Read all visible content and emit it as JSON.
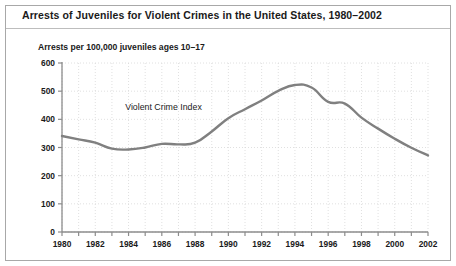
{
  "figure": {
    "title": "Arrests of Juveniles for Violent Crimes in the United States, 1980–2002",
    "axis_caption": "Arrests per 100,000 juveniles ages 10–17",
    "frame_color": "#a8a8a8",
    "background_color": "#ffffff"
  },
  "chart_data": {
    "type": "line",
    "title": "Arrests of Juveniles for Violent Crimes in the United States, 1980–2002",
    "subtitle": "Arrests per 100,000 juveniles ages 10–17",
    "xlabel": "",
    "ylabel": "Arrests per 100,000 juveniles ages 10–17",
    "xlim": [
      1980,
      2002
    ],
    "ylim": [
      0,
      600
    ],
    "yticks": [
      0,
      100,
      200,
      300,
      400,
      500,
      600
    ],
    "ytick_labels": [
      "0",
      "100",
      "200",
      "300",
      "400",
      "500",
      "600"
    ],
    "xticks": [
      1980,
      1981,
      1982,
      1983,
      1984,
      1985,
      1986,
      1987,
      1988,
      1989,
      1990,
      1991,
      1992,
      1993,
      1994,
      1995,
      1996,
      1997,
      1998,
      1999,
      2000,
      2001,
      2002
    ],
    "xtick_labels_shown": [
      "1980",
      "1982",
      "1984",
      "1986",
      "1988",
      "1990",
      "1992",
      "1994",
      "1996",
      "1998",
      "2000",
      "2002"
    ],
    "xtick_label_interval": 2,
    "grid": true,
    "grid_style": "dotted",
    "grid_color": "#d8d8d8",
    "legend": "none",
    "annotations": [
      {
        "text": "Violent Crime Index",
        "x": 1986.1,
        "y": 432
      }
    ],
    "series": [
      {
        "name": "Violent Crime Index",
        "color": "#808080",
        "line_width": 2.4,
        "x": [
          1980,
          1981,
          1982,
          1983,
          1984,
          1985,
          1986,
          1987,
          1988,
          1989,
          1990,
          1991,
          1992,
          1993,
          1994,
          1995,
          1996,
          1997,
          1998,
          1999,
          2000,
          2001,
          2002
        ],
        "values": [
          341,
          329,
          317,
          296,
          293,
          300,
          313,
          311,
          317,
          357,
          404,
          436,
          467,
          501,
          522,
          513,
          462,
          456,
          406,
          367,
          331,
          299,
          272
        ]
      }
    ]
  }
}
